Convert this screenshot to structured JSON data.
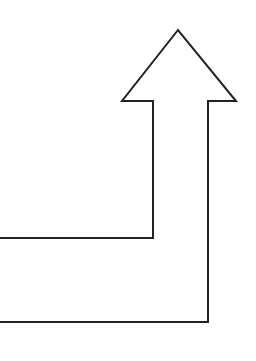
{
  "diagram": {
    "type": "bent-arrow",
    "direction": "up",
    "stroke_color": "#222222",
    "fill_color": "#ffffff",
    "background": "#ffffff",
    "stroke_width": 2,
    "points": "0,238 153,238 153,101 122,101 178,30 236,101 208,101 208,322 0,322"
  }
}
